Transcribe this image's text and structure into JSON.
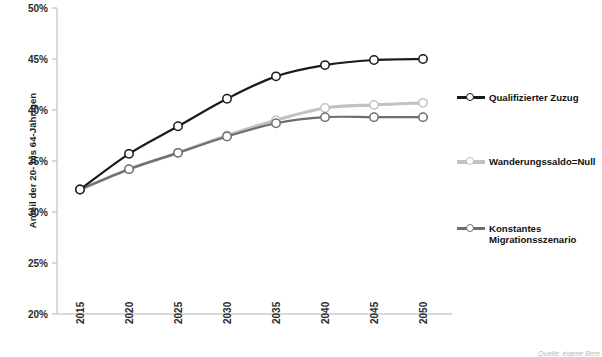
{
  "chart_data": {
    "type": "line",
    "title": "",
    "xlabel": "",
    "ylabel": "Anteil der 20- bis 64-Jährigen",
    "x": [
      2015,
      2020,
      2025,
      2030,
      2035,
      2040,
      2045,
      2050
    ],
    "xtick_labels": [
      "2015",
      "2020",
      "2025",
      "2030",
      "2035",
      "2040",
      "2045",
      "2050"
    ],
    "ytick_labels": [
      "50%",
      "45%",
      "40%",
      "35%",
      "30%",
      "25%",
      "20%"
    ],
    "ytick_values": [
      50,
      45,
      40,
      35,
      30,
      25,
      20
    ],
    "ylim": [
      20,
      50
    ],
    "xlim": [
      2015,
      2050
    ],
    "grid": false,
    "legend_position": "right",
    "series": [
      {
        "name": "Qualifizierter Zuzug",
        "color": "#1a1a1a",
        "values": [
          32.2,
          35.7,
          38.4,
          41.1,
          43.3,
          44.4,
          44.9,
          45.0
        ]
      },
      {
        "name": "Wanderungssaldo=Null",
        "color": "#c2c2c2",
        "values": [
          32.2,
          34.2,
          35.8,
          37.5,
          39.0,
          40.2,
          40.5,
          40.7
        ]
      },
      {
        "name": "Konstantes Migrationsszenario",
        "color": "#6e6e6e",
        "values": [
          32.2,
          34.2,
          35.8,
          37.4,
          38.7,
          39.3,
          39.3,
          39.3
        ]
      }
    ]
  },
  "legend": {
    "items": [
      {
        "label": "Qualifizierter Zuzug",
        "color": "#1a1a1a"
      },
      {
        "label": "Wanderungssaldo=Null",
        "color": "#c2c2c2"
      },
      {
        "label": "Konstantes",
        "label2": "Migrationsszenario",
        "color": "#6e6e6e"
      }
    ]
  },
  "footer": {
    "source": "Quelle: eigene Bere"
  },
  "axes": {
    "y_title": "Anteil der 20- bis 64-Jährigen",
    "axis_color": "#b5b5b5"
  }
}
